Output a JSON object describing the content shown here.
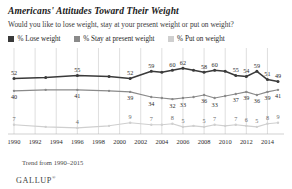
{
  "header": {
    "title": "Americans' Attitudes Toward Their Weight",
    "subtitle": "Would you like to lose weight, stay at your present weight or put on weight?"
  },
  "legend": [
    {
      "label": "% Lose weight",
      "color": "#3a3a3a",
      "key": "lose"
    },
    {
      "label": "% Stay at present weight",
      "color": "#8a8a8a",
      "key": "stay"
    },
    {
      "label": "% Put on weight",
      "color": "#cfcfcf",
      "key": "put"
    }
  ],
  "footer": {
    "trend": "Trend from 1990–2015",
    "brand": "GALLUP",
    "brand_mark": "®"
  },
  "chart_data": {
    "type": "line",
    "title": "Americans' Attitudes Toward Their Weight",
    "subtitle": "Would you like to lose weight, stay at your present weight or put on weight?",
    "xlabel": "",
    "ylabel": "",
    "ylim": [
      0,
      70
    ],
    "grid": "vertical",
    "legend_position": "top",
    "xticks": [
      "1990",
      "1992",
      "1994",
      "1996",
      "1998",
      "2000",
      "2002",
      "2004",
      "2006",
      "2008",
      "2010",
      "2012",
      "2014"
    ],
    "x": [
      1990,
      1991,
      1992,
      1993,
      1994,
      1995,
      1996,
      1997,
      1998,
      1999,
      2000,
      2001,
      2002,
      2003,
      2004,
      2005,
      2006,
      2007,
      2008,
      2009,
      2010,
      2011,
      2012,
      2013,
      2014,
      2015
    ],
    "series": [
      {
        "name": "% Lose weight",
        "color": "#3a3a3a",
        "points": [
          {
            "x": 1990,
            "y": 52,
            "label": "52"
          },
          {
            "x": 1993,
            "y": 53,
            "label": ""
          },
          {
            "x": 1996,
            "y": 55,
            "label": "55"
          },
          {
            "x": 1999,
            "y": 54,
            "label": ""
          },
          {
            "x": 2001,
            "y": 52,
            "label": "52"
          },
          {
            "x": 2003,
            "y": 59,
            "label": "59"
          },
          {
            "x": 2004,
            "y": 58,
            "label": ""
          },
          {
            "x": 2005,
            "y": 60,
            "label": "60"
          },
          {
            "x": 2006,
            "y": 62,
            "label": "62"
          },
          {
            "x": 2007,
            "y": 60,
            "label": ""
          },
          {
            "x": 2008,
            "y": 58,
            "label": "58"
          },
          {
            "x": 2009,
            "y": 60,
            "label": "60"
          },
          {
            "x": 2010,
            "y": 59,
            "label": ""
          },
          {
            "x": 2011,
            "y": 55,
            "label": "55"
          },
          {
            "x": 2012,
            "y": 54,
            "label": "54"
          },
          {
            "x": 2013,
            "y": 59,
            "label": "59"
          },
          {
            "x": 2014,
            "y": 51,
            "label": "51"
          },
          {
            "x": 2015,
            "y": 49,
            "label": "49"
          }
        ]
      },
      {
        "name": "% Stay at present weight",
        "color": "#8a8a8a",
        "points": [
          {
            "x": 1990,
            "y": 40,
            "label": "40"
          },
          {
            "x": 1993,
            "y": 41,
            "label": ""
          },
          {
            "x": 1996,
            "y": 41,
            "label": "41"
          },
          {
            "x": 1999,
            "y": 40,
            "label": ""
          },
          {
            "x": 2001,
            "y": 39,
            "label": "39"
          },
          {
            "x": 2003,
            "y": 34,
            "label": "34"
          },
          {
            "x": 2004,
            "y": 33,
            "label": ""
          },
          {
            "x": 2005,
            "y": 32,
            "label": "32"
          },
          {
            "x": 2006,
            "y": 33,
            "label": "33"
          },
          {
            "x": 2007,
            "y": 34,
            "label": ""
          },
          {
            "x": 2008,
            "y": 36,
            "label": "36"
          },
          {
            "x": 2009,
            "y": 33,
            "label": "33"
          },
          {
            "x": 2010,
            "y": 35,
            "label": ""
          },
          {
            "x": 2011,
            "y": 37,
            "label": "37"
          },
          {
            "x": 2012,
            "y": 39,
            "label": "39"
          },
          {
            "x": 2013,
            "y": 36,
            "label": "36"
          },
          {
            "x": 2014,
            "y": 39,
            "label": "39"
          },
          {
            "x": 2015,
            "y": 41,
            "label": "41"
          }
        ]
      },
      {
        "name": "% Put on weight",
        "color": "#cfcfcf",
        "points": [
          {
            "x": 1990,
            "y": 7,
            "label": "7"
          },
          {
            "x": 1993,
            "y": 5,
            "label": ""
          },
          {
            "x": 1996,
            "y": 4,
            "label": "4"
          },
          {
            "x": 1999,
            "y": 6,
            "label": ""
          },
          {
            "x": 2001,
            "y": 9,
            "label": "9"
          },
          {
            "x": 2003,
            "y": 7,
            "label": "7"
          },
          {
            "x": 2004,
            "y": 7,
            "label": ""
          },
          {
            "x": 2005,
            "y": 8,
            "label": "8"
          },
          {
            "x": 2006,
            "y": 5,
            "label": "5"
          },
          {
            "x": 2007,
            "y": 6,
            "label": ""
          },
          {
            "x": 2008,
            "y": 5,
            "label": "5"
          },
          {
            "x": 2009,
            "y": 7,
            "label": "7"
          },
          {
            "x": 2010,
            "y": 6,
            "label": ""
          },
          {
            "x": 2011,
            "y": 7,
            "label": "7"
          },
          {
            "x": 2012,
            "y": 6,
            "label": "6"
          },
          {
            "x": 2013,
            "y": 5,
            "label": "5"
          },
          {
            "x": 2014,
            "y": 8,
            "label": "8"
          },
          {
            "x": 2015,
            "y": 9,
            "label": "9"
          }
        ]
      }
    ]
  }
}
